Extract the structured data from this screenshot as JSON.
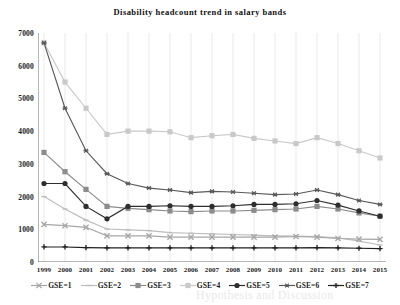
{
  "chart_data": {
    "type": "line",
    "title": "Disability headcount trend in salary bands",
    "xlabel": "",
    "ylabel": "",
    "categories": [
      "1999",
      "2000",
      "2001",
      "2002",
      "2003",
      "2004",
      "2005",
      "2006",
      "2007",
      "2008",
      "2009",
      "2010",
      "2011",
      "2012",
      "2013",
      "2014",
      "2015"
    ],
    "ylim": [
      0,
      7000
    ],
    "yticks": [
      0,
      1000,
      2000,
      3000,
      4000,
      5000,
      6000,
      7000
    ],
    "grid": "vertical",
    "legend_position": "bottom",
    "series": [
      {
        "name": "GSE=1",
        "color": "#a6a6a6",
        "marker": "x",
        "values": [
          1150,
          1110,
          1060,
          800,
          800,
          800,
          760,
          760,
          760,
          760,
          760,
          760,
          780,
          760,
          720,
          700,
          690
        ]
      },
      {
        "name": "GSE=2",
        "color": "#bdbdbd",
        "marker": "dash",
        "values": [
          2000,
          1620,
          1280,
          1010,
          980,
          960,
          900,
          880,
          860,
          840,
          820,
          800,
          790,
          780,
          740,
          640,
          520
        ]
      },
      {
        "name": "GSE=3",
        "color": "#8c8c8c",
        "marker": "square",
        "values": [
          3350,
          2760,
          2220,
          1700,
          1640,
          1600,
          1560,
          1540,
          1560,
          1560,
          1580,
          1600,
          1620,
          1700,
          1620,
          1500,
          1400
        ]
      },
      {
        "name": "GSE=4",
        "color": "#c9c9c9",
        "marker": "square",
        "values": [
          6700,
          5500,
          4700,
          3900,
          4000,
          4000,
          3980,
          3800,
          3860,
          3900,
          3780,
          3700,
          3620,
          3800,
          3620,
          3400,
          3180
        ]
      },
      {
        "name": "GSE=5",
        "color": "#2e2e2e",
        "marker": "circle",
        "values": [
          2400,
          2400,
          1700,
          1320,
          1700,
          1700,
          1720,
          1700,
          1700,
          1720,
          1760,
          1760,
          1780,
          1880,
          1740,
          1560,
          1400
        ]
      },
      {
        "name": "GSE=6",
        "color": "#595959",
        "marker": "asterisk",
        "values": [
          6700,
          4700,
          3400,
          2700,
          2400,
          2260,
          2200,
          2120,
          2160,
          2140,
          2100,
          2060,
          2080,
          2200,
          2060,
          1880,
          1760
        ]
      },
      {
        "name": "GSE=7",
        "color": "#1f1f1f",
        "marker": "plus",
        "values": [
          460,
          460,
          440,
          430,
          430,
          430,
          430,
          430,
          430,
          430,
          430,
          430,
          430,
          440,
          430,
          420,
          410
        ]
      }
    ]
  },
  "watermark": {
    "text": "Hypothesis and Discussion"
  }
}
